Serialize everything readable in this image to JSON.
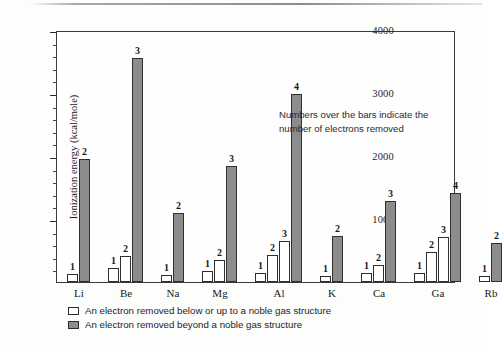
{
  "chart_data": {
    "type": "bar",
    "title": "",
    "xlabel": "",
    "ylabel": "Ionization energy   (kcal/mole)",
    "ylim": [
      0,
      4000
    ],
    "y_major_ticks": [
      0,
      1000,
      2000,
      3000,
      4000
    ],
    "y_tick_labels": [
      "1000",
      "2000",
      "3000",
      "4000"
    ],
    "y_minor_tick_interval": 200,
    "grid": false,
    "legend_position": "below-axes",
    "annotation": "Numbers over the bars indicate the number of electrons removed",
    "categories": [
      "Li",
      "Be",
      "Na",
      "Mg",
      "Al",
      "K",
      "Ca",
      "Ga",
      "Rb"
    ],
    "series": [
      {
        "name": "An electron removed below or up to a noble gas structure",
        "key": "white",
        "color": "#ffffff"
      },
      {
        "name": "An electron removed beyond a noble gas structure",
        "key": "gray",
        "color": "#8c8c8c"
      }
    ],
    "groups": [
      {
        "category": "Li",
        "bars": [
          {
            "electron_number": "1",
            "value": 124,
            "series": "white"
          },
          {
            "electron_number": "2",
            "value": 1960,
            "series": "gray"
          }
        ]
      },
      {
        "category": "Be",
        "bars": [
          {
            "electron_number": "1",
            "value": 215,
            "series": "white"
          },
          {
            "electron_number": "2",
            "value": 420,
            "series": "white"
          },
          {
            "electron_number": "3",
            "value": 3550,
            "series": "gray"
          }
        ]
      },
      {
        "category": "Na",
        "bars": [
          {
            "electron_number": "1",
            "value": 118,
            "series": "white"
          },
          {
            "electron_number": "2",
            "value": 1090,
            "series": "gray"
          }
        ]
      },
      {
        "category": "Mg",
        "bars": [
          {
            "electron_number": "1",
            "value": 176,
            "series": "white"
          },
          {
            "electron_number": "2",
            "value": 346,
            "series": "white"
          },
          {
            "electron_number": "3",
            "value": 1840,
            "series": "gray"
          }
        ]
      },
      {
        "category": "Al",
        "bars": [
          {
            "electron_number": "1",
            "value": 138,
            "series": "white"
          },
          {
            "electron_number": "2",
            "value": 434,
            "series": "white"
          },
          {
            "electron_number": "3",
            "value": 656,
            "series": "white"
          },
          {
            "electron_number": "4",
            "value": 2990,
            "series": "gray"
          }
        ]
      },
      {
        "category": "K",
        "bars": [
          {
            "electron_number": "1",
            "value": 100,
            "series": "white"
          },
          {
            "electron_number": "2",
            "value": 734,
            "series": "gray"
          }
        ]
      },
      {
        "category": "Ca",
        "bars": [
          {
            "electron_number": "1",
            "value": 141,
            "series": "white"
          },
          {
            "electron_number": "2",
            "value": 274,
            "series": "white"
          },
          {
            "electron_number": "3",
            "value": 1280,
            "series": "gray"
          }
        ]
      },
      {
        "category": "Ga",
        "bars": [
          {
            "electron_number": "1",
            "value": 138,
            "series": "white"
          },
          {
            "electron_number": "2",
            "value": 473,
            "series": "white"
          },
          {
            "electron_number": "3",
            "value": 708,
            "series": "white"
          },
          {
            "electron_number": "4",
            "value": 1420,
            "series": "gray"
          }
        ]
      },
      {
        "category": "Rb",
        "bars": [
          {
            "electron_number": "1",
            "value": 96,
            "series": "white"
          },
          {
            "electron_number": "2",
            "value": 620,
            "series": "gray"
          }
        ]
      }
    ]
  },
  "legend": {
    "items": [
      {
        "swatch": "white",
        "label": "An electron removed below or up to a noble gas structure"
      },
      {
        "swatch": "gray",
        "label": "An electron removed beyond a noble gas structure"
      }
    ]
  }
}
